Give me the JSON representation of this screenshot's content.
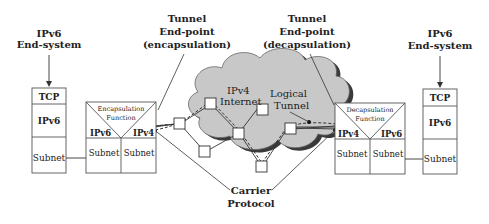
{
  "left_end_system": {
    "title_line1": "IPv6",
    "title_line2": "End-system",
    "layers": [
      "TCP",
      "IPv6",
      "Subnet"
    ]
  },
  "right_end_system": {
    "title_line1": "IPv6",
    "title_line2": "End-system",
    "layers": [
      "TCP",
      "IPv6",
      "Subnet"
    ]
  },
  "encap_router": {
    "function_line1": "Encapsulation",
    "function_line2": "Function",
    "left_proto": "IPv6",
    "right_proto": "IPv4",
    "left_subnet": "Subnet",
    "right_subnet": "Subnet"
  },
  "decap_router": {
    "function_line1": "Decapsulation",
    "function_line2": "Function",
    "left_proto": "IPv4",
    "right_proto": "IPv6",
    "left_subnet": "Subnet",
    "right_subnet": "Subnet"
  },
  "tunnel_encap_label": {
    "line1": "Tunnel",
    "line2": "End-point",
    "line3": "(encapsulation)"
  },
  "tunnel_decap_label": {
    "line1": "Tunnel",
    "line2": "End-point",
    "line3": "(decapsulation)"
  },
  "cloud": {
    "line1": "IPv4",
    "line2": "Internet",
    "tunnel_line1": "Logical",
    "tunnel_line2": "Tunnel",
    "fill": "#c8c8c8",
    "shadow": "#3a3a3a"
  },
  "carrier_label": {
    "line1": "Carrier",
    "line2": "Protocol"
  }
}
